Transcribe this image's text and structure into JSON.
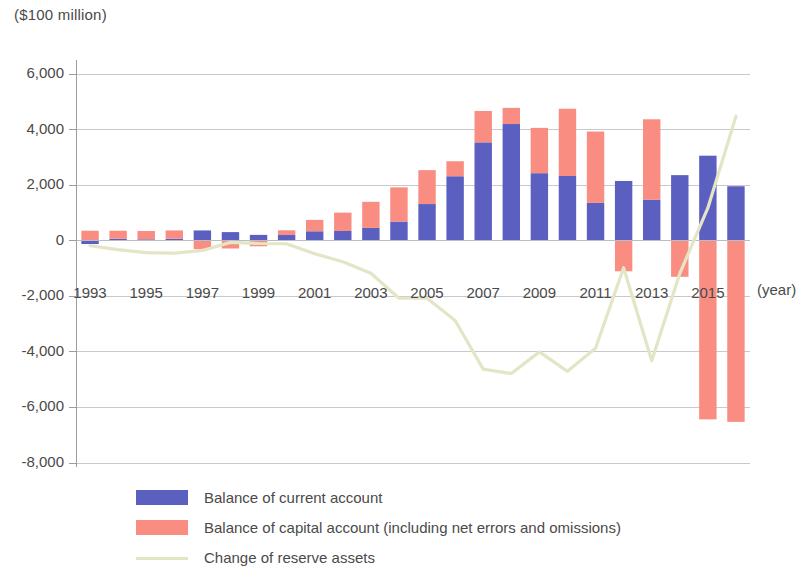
{
  "chart_data": {
    "type": "bar",
    "title": "($100 million)",
    "xlabel": "(year)",
    "ylabel": "($100 million)",
    "ylim": [
      -8000,
      6000
    ],
    "ytick_step": 2000,
    "ytick_labels": [
      "6,000",
      "4,000",
      "2,000",
      "0",
      "-2,000",
      "-4,000",
      "-6,000",
      "-8,000"
    ],
    "ytick_values": [
      6000,
      4000,
      2000,
      0,
      -2000,
      -4000,
      -6000,
      -8000
    ],
    "grid": true,
    "stacked": true,
    "legend_position": "bottom",
    "categories": [
      "1993",
      "1994",
      "1995",
      "1996",
      "1997",
      "1998",
      "1999",
      "2000",
      "2001",
      "2002",
      "2003",
      "2004",
      "2005",
      "2006",
      "2007",
      "2008",
      "2009",
      "2010",
      "2011",
      "2012",
      "2013",
      "2014",
      "2015",
      "2016"
    ],
    "xtick_labels": [
      "1993",
      "1995",
      "1997",
      "1999",
      "2001",
      "2003",
      "2005",
      "2007",
      "2009",
      "2011",
      "2013",
      "2015"
    ],
    "series": [
      {
        "name": "Balance of current account",
        "color": "#5b60c0",
        "type": "bar",
        "values": [
          -120,
          70,
          50,
          70,
          370,
          310,
          210,
          205,
          340,
          350,
          460,
          690,
          1320,
          2320,
          3540,
          4200,
          2430,
          2330,
          1360,
          2150,
          1480,
          2360,
          3060,
          1960
        ]
      },
      {
        "name": "Balance of capital account (including net errors and omissions)",
        "color": "#f98d82",
        "type": "bar",
        "values": [
          360,
          290,
          300,
          300,
          -300,
          -280,
          -200,
          170,
          410,
          660,
          940,
          1230,
          1220,
          540,
          1130,
          580,
          1630,
          2420,
          2570,
          -1100,
          2890,
          -1300,
          -6430,
          -6520
        ]
      },
      {
        "name": "Change of reserve assets",
        "color": "#e3e5c4",
        "type": "line",
        "values": [
          -180,
          -320,
          -430,
          -450,
          -350,
          -60,
          -100,
          -110,
          -470,
          -760,
          -1170,
          -2070,
          -2070,
          -2870,
          -4620,
          -4780,
          -4000,
          -4700,
          -3870,
          -970,
          -4320,
          -1180,
          1180,
          4480
        ]
      }
    ]
  },
  "legend": {
    "items": [
      {
        "label": "Balance of current account",
        "swatch": "bar",
        "color": "#5b60c0"
      },
      {
        "label": "Balance of capital account (including net errors and omissions)",
        "swatch": "bar",
        "color": "#f98d82"
      },
      {
        "label": "Change of reserve assets",
        "swatch": "line",
        "color": "#e3e5c4"
      }
    ]
  },
  "axis": {
    "unit_title": "($100 million)",
    "x_axis_title": "(year)"
  },
  "colors": {
    "current_account": "#5b60c0",
    "capital_account": "#f98d82",
    "reserve_assets": "#e3e5c4",
    "grid": "#b9bcc4",
    "axis": "#9a9da4",
    "text": "#4a4a4a"
  }
}
